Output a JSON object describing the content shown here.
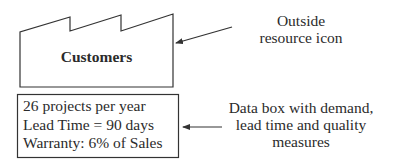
{
  "customer_icon": {
    "type": "outside-resource-icon",
    "label": "Customers"
  },
  "data_box": {
    "lines": [
      "26 projects per year",
      "Lead Time = 90 days",
      "Warranty: 6% of Sales"
    ]
  },
  "annotations": {
    "outside_resource": {
      "lines": [
        "Outside",
        "resource icon"
      ]
    },
    "data_box": {
      "lines": [
        "Data box with demand,",
        "lead time and quality",
        "measures"
      ]
    }
  },
  "colors": {
    "stroke": "#333333",
    "text": "#2b2b2b",
    "background": "#ffffff"
  }
}
